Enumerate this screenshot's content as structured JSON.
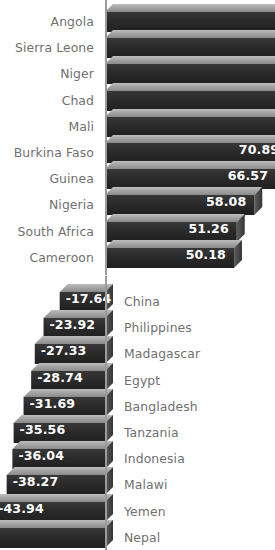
{
  "chart_data": {
    "type": "bar",
    "orientation": "horizontal",
    "title": "",
    "subtitle": "",
    "xlabel": "",
    "ylabel": "",
    "grid": false,
    "legend": null,
    "axis_zero_x_px": 105,
    "px_per_unit": 2.57,
    "note": "Diverging horizontal 3D bar chart; top group positive values, bottom group negative values. Longest positive bars are clipped by the right image edge; the most negative bar is clipped by the left image edge.",
    "groups": [
      {
        "name": "positive",
        "label_side": "left",
        "categories": [
          "Angola",
          "Sierra Leone",
          "Niger",
          "Chad",
          "Mali",
          "Burkina Faso",
          "Guinea",
          "Nigeria",
          "South Africa",
          "Cameroon"
        ],
        "values": [
          null,
          null,
          null,
          null,
          77,
          70.89,
          66.57,
          58.08,
          51.26,
          50.18
        ],
        "value_labels": [
          "",
          "",
          "",
          "",
          "77",
          "70.89",
          "66.57",
          "58.08",
          "51.26",
          "50.18"
        ],
        "clipped": [
          true,
          true,
          true,
          true,
          true,
          true,
          false,
          false,
          false,
          false
        ]
      },
      {
        "name": "negative",
        "label_side": "right",
        "categories": [
          "China",
          "Philippines",
          "Madagascar",
          "Egypt",
          "Bangladesh",
          "Tanzania",
          "Indonesia",
          "Malawi",
          "Yemen",
          "Nepal"
        ],
        "values": [
          -17.64,
          -23.92,
          -27.33,
          -28.74,
          -31.69,
          -35.56,
          -36.04,
          -38.27,
          -43.94,
          null
        ],
        "value_labels": [
          "-17.64",
          "-23.92",
          "-27.33",
          "-28.74",
          "-31.69",
          "-35.56",
          "-36.04",
          "-38.27",
          "-43.94",
          "3"
        ],
        "clipped": [
          false,
          false,
          false,
          false,
          false,
          false,
          false,
          false,
          false,
          true
        ]
      }
    ]
  },
  "colors": {
    "bar_front": "#2b2b2b",
    "bar_top": "#9c9c9c",
    "bar_side": "#4a4a4a",
    "axis": "#9b9b9b",
    "category_text": "#707070",
    "value_text": "#ffffff",
    "background": "#ffffff"
  }
}
